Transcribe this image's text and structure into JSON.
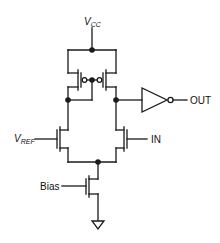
{
  "diagram": {
    "type": "circuit-schematic",
    "labels": {
      "vcc_main": "V",
      "vcc_sub": "CC",
      "vref_main": "V",
      "vref_sub": "REF",
      "in": "IN",
      "out": "OUT",
      "bias": "Bias"
    },
    "components": [
      {
        "id": "M1",
        "kind": "pmos",
        "role": "mirror-left"
      },
      {
        "id": "M2",
        "kind": "pmos",
        "role": "mirror-right"
      },
      {
        "id": "M3",
        "kind": "nmos",
        "role": "diff-pair-left",
        "gate": "VREF"
      },
      {
        "id": "M4",
        "kind": "nmos",
        "role": "diff-pair-right",
        "gate": "IN"
      },
      {
        "id": "M5",
        "kind": "nmos",
        "role": "tail-current-source",
        "gate": "Bias"
      },
      {
        "id": "U1",
        "kind": "inverter",
        "output": "OUT"
      },
      {
        "id": "GND",
        "kind": "ground"
      }
    ],
    "colors": {
      "stroke": "#1a1a1a",
      "background": "#ffffff"
    }
  }
}
